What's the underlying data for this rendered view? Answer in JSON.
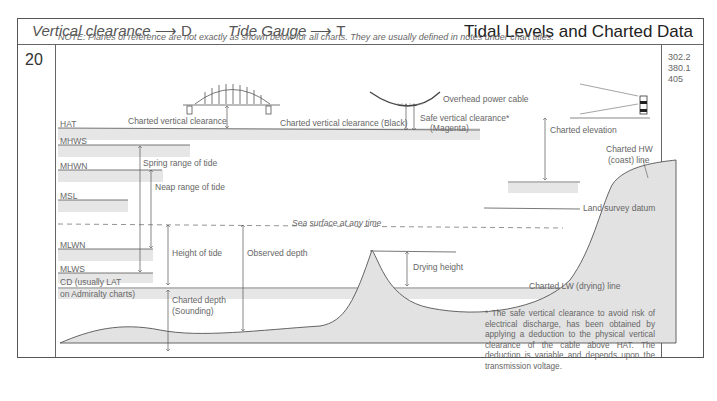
{
  "header": {
    "legend_vertical_clearance": "Vertical clearance",
    "legend_vertical_clearance_arrow": "⟶",
    "legend_vertical_clearance_code": "D",
    "legend_tide_gauge": "Tide Gauge",
    "legend_tide_gauge_arrow": "⟶",
    "legend_tide_gauge_code": "T",
    "title": "Tidal Levels and Charted Data"
  },
  "page_number": "20",
  "side_values": [
    "302.2",
    "380.1",
    "405"
  ],
  "note": "NOTE: Planes of reference are not exactly as shown below for all charts. They are usually defined in notes under chart titles.",
  "levels": {
    "hat": "HAT",
    "mhws": "MHWS",
    "mhwn": "MHWN",
    "msl": "MSL",
    "mlwn": "MLWN",
    "mlws": "MLWS",
    "cd_line1": "CD (usually LAT",
    "cd_line2": "on Admiralty charts)"
  },
  "labels": {
    "bridge_clearance": "Charted vertical clearance",
    "cable_clearance_black": "Charted vertical clearance (Black)",
    "safe_clearance_line1": "Safe vertical clearance*",
    "safe_clearance_line2": "(Magenta)",
    "overhead_cable": "Overhead power cable",
    "charted_elevation": "Charted elevation",
    "charted_hw_line1": "Charted HW",
    "charted_hw_line2": "(coast) line",
    "spring_range": "Spring range of tide",
    "neap_range": "Neap range of tide",
    "sea_surface": "Sea surface at any time",
    "land_survey_datum": "Land survey datum",
    "height_of_tide": "Height of tide",
    "observed_depth": "Observed depth",
    "drying_height": "Drying height",
    "charted_lw": "Charted LW (drying) line",
    "charted_depth_line1": "Charted depth",
    "charted_depth_line2": "(Sounding)"
  },
  "footnote": "* The safe vertical clearance to avoid risk of electrical discharge, has been obtained by applying a deduction to the physical vertical clearance of the cable above HAT. The deduction is variable and depends upon the transmission voltage.",
  "colors": {
    "band_gray": "#e4e4e4",
    "seabed_gray": "#e2e2e2",
    "line": "#555555"
  }
}
